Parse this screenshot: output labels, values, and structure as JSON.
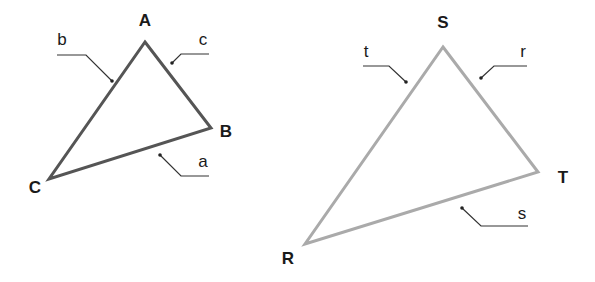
{
  "diagram": {
    "triangles": [
      {
        "id": "ABC",
        "stroke_color": "#555555",
        "vertices": [
          {
            "label": "A",
            "x": 145,
            "y": 42,
            "label_x": 145,
            "label_y": 26
          },
          {
            "label": "B",
            "x": 211,
            "y": 128,
            "label_x": 226,
            "label_y": 137
          },
          {
            "label": "C",
            "x": 49,
            "y": 179,
            "label_x": 35,
            "label_y": 193
          }
        ],
        "sides": [
          {
            "label": "a",
            "between": "B-C",
            "label_x": 203,
            "label_y": 167,
            "leader": "160,155 181,176 209,176",
            "dot_x": 160,
            "dot_y": 155
          },
          {
            "label": "b",
            "between": "A-C",
            "label_x": 62,
            "label_y": 45,
            "leader": "57,55 86,55 112,81",
            "dot_x": 112,
            "dot_y": 81
          },
          {
            "label": "c",
            "between": "A-B",
            "label_x": 203,
            "label_y": 45,
            "leader": "172,63 181,54 209,54",
            "dot_x": 172,
            "dot_y": 63
          }
        ]
      },
      {
        "id": "RST",
        "stroke_color": "#aaaaaa",
        "vertices": [
          {
            "label": "S",
            "x": 443,
            "y": 47,
            "label_x": 443,
            "label_y": 28
          },
          {
            "label": "T",
            "x": 538,
            "y": 172,
            "label_x": 563,
            "label_y": 183
          },
          {
            "label": "R",
            "x": 305,
            "y": 244,
            "label_x": 288,
            "label_y": 264
          }
        ],
        "sides": [
          {
            "label": "s",
            "between": "R-T",
            "label_x": 522,
            "label_y": 219,
            "leader": "462,208 481,226 528,226",
            "dot_x": 462,
            "dot_y": 208
          },
          {
            "label": "t",
            "between": "R-S",
            "label_x": 366,
            "label_y": 57,
            "leader": "363,66 389,66 406,82",
            "dot_x": 406,
            "dot_y": 82
          },
          {
            "label": "r",
            "between": "S-T",
            "label_x": 523,
            "label_y": 57,
            "leader": "481,78 494,66 527,66",
            "dot_x": 481,
            "dot_y": 78
          }
        ]
      }
    ]
  }
}
